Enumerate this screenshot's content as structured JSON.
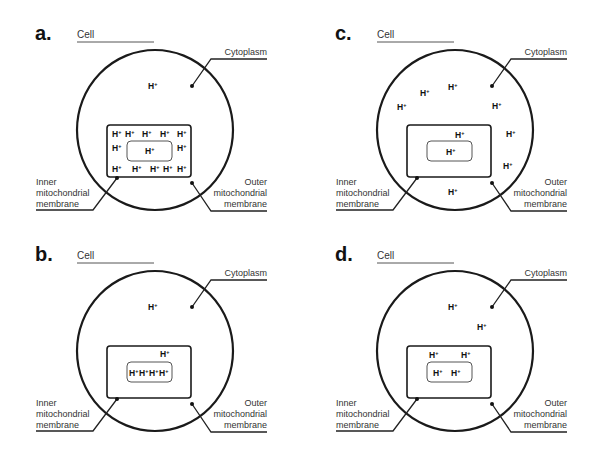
{
  "figure": {
    "panels": [
      {
        "letter": "a.",
        "cell_label": "Cell",
        "cytoplasm_label": "Cytoplasm",
        "inner_label": [
          "Inner",
          "mitochondrial",
          "membrane"
        ],
        "outer_label": [
          "Outer",
          "mitochondrial",
          "membrane"
        ],
        "ions": {
          "cytoplasm": 1,
          "intermembrane_space": 12,
          "matrix": 1
        }
      },
      {
        "letter": "b.",
        "cell_label": "Cell",
        "cytoplasm_label": "Cytoplasm",
        "inner_label": [
          "Inner",
          "mitochondrial",
          "membrane"
        ],
        "outer_label": [
          "Outer",
          "mitochondrial",
          "membrane"
        ],
        "ions": {
          "cytoplasm": 1,
          "intermembrane_space": 1,
          "matrix": 4
        }
      },
      {
        "letter": "c.",
        "cell_label": "Cell",
        "cytoplasm_label": "Cytoplasm",
        "inner_label": [
          "Inner",
          "mitochondrial",
          "membrane"
        ],
        "outer_label": [
          "Outer",
          "mitochondrial",
          "membrane"
        ],
        "ions": {
          "cytoplasm": 8,
          "intermembrane_space": 1,
          "matrix": 1
        }
      },
      {
        "letter": "d.",
        "cell_label": "Cell",
        "cytoplasm_label": "Cytoplasm",
        "inner_label": [
          "Inner",
          "mitochondrial",
          "membrane"
        ],
        "outer_label": [
          "Outer",
          "mitochondrial",
          "membrane"
        ],
        "ions": {
          "cytoplasm": 2,
          "intermembrane_space": 2,
          "matrix": 2
        }
      }
    ],
    "ion_symbol": "H",
    "ion_charge": "+"
  }
}
